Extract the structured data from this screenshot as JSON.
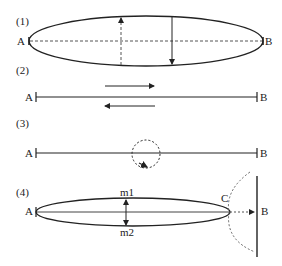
{
  "panels": [
    {
      "label": "(1)",
      "endpoints": {
        "left": "A",
        "right": "B"
      }
    },
    {
      "label": "(2)",
      "endpoints": {
        "left": "A",
        "right": "B"
      }
    },
    {
      "label": "(3)",
      "endpoints": {
        "left": "A",
        "right": "B"
      }
    },
    {
      "label": "(4)",
      "endpoints": {
        "left": "A",
        "right": "B"
      },
      "points": {
        "top": "m1",
        "bottom": "m2",
        "tip": "C"
      }
    }
  ],
  "colors": {
    "stroke": "#222222",
    "dashed": "#555555",
    "background": "#ffffff"
  }
}
